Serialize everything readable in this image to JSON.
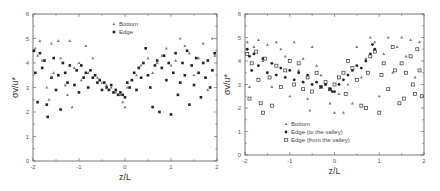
{
  "chart_data": [
    {
      "type": "scatter",
      "panel": "left",
      "xlabel": "z/L",
      "ylabel": "σv/u*",
      "xlim": [
        -2,
        2
      ],
      "ylim": [
        0,
        6
      ],
      "xticks": [
        "-2",
        "-1",
        "0",
        "1",
        "2"
      ],
      "yticks": [
        "0",
        "1",
        "2",
        "3",
        "4",
        "5",
        "6"
      ],
      "grid": false,
      "legend_position": "upper center",
      "series": [
        {
          "name": "Bottom",
          "marker": "triangle",
          "points": [
            [
              -1.95,
              4.6
            ],
            [
              -1.9,
              4.3
            ],
            [
              -1.85,
              4.9
            ],
            [
              -1.8,
              4.1
            ],
            [
              -1.7,
              3.0
            ],
            [
              -1.65,
              2.5
            ],
            [
              -1.6,
              4.8
            ],
            [
              -1.55,
              3.6
            ],
            [
              -1.45,
              4.9
            ],
            [
              -1.4,
              4.2
            ],
            [
              -1.3,
              3.1
            ],
            [
              -1.25,
              2.7
            ],
            [
              -1.2,
              4.9
            ],
            [
              -1.15,
              2.2
            ],
            [
              -1.1,
              3.8
            ],
            [
              -1.0,
              4.0
            ],
            [
              -0.95,
              3.3
            ],
            [
              -0.85,
              4.7
            ],
            [
              -0.8,
              3.6
            ],
            [
              -0.7,
              4.2
            ],
            [
              -0.6,
              3.4
            ],
            [
              -0.5,
              3.2
            ],
            [
              -0.4,
              3.1
            ],
            [
              -0.3,
              3.0
            ],
            [
              -0.2,
              2.8
            ],
            [
              -0.1,
              2.7
            ],
            [
              -0.05,
              2.4
            ],
            [
              0.0,
              2.2
            ],
            [
              0.05,
              3.0
            ],
            [
              0.15,
              3.3
            ],
            [
              0.25,
              3.5
            ],
            [
              0.35,
              3.9
            ],
            [
              0.5,
              4.2
            ],
            [
              0.6,
              3.6
            ],
            [
              0.7,
              4.0
            ],
            [
              0.8,
              4.3
            ],
            [
              0.9,
              4.6
            ],
            [
              1.0,
              3.9
            ],
            [
              1.1,
              4.1
            ],
            [
              1.2,
              5.0
            ],
            [
              1.3,
              4.7
            ],
            [
              1.4,
              4.4
            ],
            [
              1.5,
              3.5
            ],
            [
              1.6,
              4.2
            ],
            [
              1.7,
              4.8
            ],
            [
              1.8,
              2.9
            ],
            [
              1.9,
              5.0
            ],
            [
              1.95,
              4.3
            ]
          ]
        },
        {
          "name": "Edge",
          "marker": "filled-square",
          "points": [
            [
              -1.98,
              4.5
            ],
            [
              -1.95,
              3.6
            ],
            [
              -1.9,
              2.4
            ],
            [
              -1.85,
              4.4
            ],
            [
              -1.8,
              3.8
            ],
            [
              -1.75,
              4.1
            ],
            [
              -1.7,
              2.3
            ],
            [
              -1.68,
              1.8
            ],
            [
              -1.6,
              3.4
            ],
            [
              -1.55,
              4.2
            ],
            [
              -1.5,
              2.9
            ],
            [
              -1.45,
              3.5
            ],
            [
              -1.4,
              2.1
            ],
            [
              -1.35,
              4.0
            ],
            [
              -1.3,
              3.6
            ],
            [
              -1.25,
              3.2
            ],
            [
              -1.2,
              3.9
            ],
            [
              -1.1,
              3.1
            ],
            [
              -1.05,
              3.7
            ],
            [
              -1.0,
              2.8
            ],
            [
              -0.95,
              3.9
            ],
            [
              -0.9,
              3.4
            ],
            [
              -0.85,
              3.6
            ],
            [
              -0.8,
              3.0
            ],
            [
              -0.75,
              3.7
            ],
            [
              -0.7,
              3.4
            ],
            [
              -0.65,
              3.5
            ],
            [
              -0.6,
              3.2
            ],
            [
              -0.55,
              3.3
            ],
            [
              -0.5,
              2.9
            ],
            [
              -0.45,
              3.2
            ],
            [
              -0.4,
              3.0
            ],
            [
              -0.35,
              2.9
            ],
            [
              -0.3,
              3.1
            ],
            [
              -0.25,
              2.8
            ],
            [
              -0.2,
              2.9
            ],
            [
              -0.15,
              2.7
            ],
            [
              -0.1,
              2.8
            ],
            [
              -0.05,
              2.7
            ],
            [
              0.0,
              2.6
            ],
            [
              0.05,
              3.2
            ],
            [
              0.1,
              3.0
            ],
            [
              0.15,
              3.3
            ],
            [
              0.2,
              3.6
            ],
            [
              0.25,
              2.9
            ],
            [
              0.3,
              3.8
            ],
            [
              0.35,
              3.4
            ],
            [
              0.4,
              4.0
            ],
            [
              0.45,
              4.6
            ],
            [
              0.5,
              3.5
            ],
            [
              0.55,
              3.0
            ],
            [
              0.6,
              2.2
            ],
            [
              0.65,
              3.9
            ],
            [
              0.7,
              4.1
            ],
            [
              0.75,
              2.0
            ],
            [
              0.8,
              3.8
            ],
            [
              0.85,
              4.3
            ],
            [
              0.9,
              3.3
            ],
            [
              0.95,
              4.0
            ],
            [
              1.0,
              1.9
            ],
            [
              1.05,
              3.6
            ],
            [
              1.1,
              4.4
            ],
            [
              1.15,
              2.7
            ],
            [
              1.2,
              3.2
            ],
            [
              1.25,
              4.0
            ],
            [
              1.3,
              3.5
            ],
            [
              1.35,
              4.5
            ],
            [
              1.4,
              2.3
            ],
            [
              1.45,
              3.9
            ],
            [
              1.5,
              3.1
            ],
            [
              1.55,
              4.2
            ],
            [
              1.6,
              3.6
            ],
            [
              1.65,
              2.6
            ],
            [
              1.7,
              4.0
            ],
            [
              1.75,
              3.4
            ],
            [
              1.8,
              4.1
            ],
            [
              1.85,
              3.0
            ],
            [
              1.9,
              3.7
            ],
            [
              1.95,
              4.4
            ]
          ]
        }
      ]
    },
    {
      "type": "scatter",
      "panel": "right",
      "xlabel": "z/L",
      "ylabel": "σv/u*",
      "xlim": [
        -2,
        2
      ],
      "ylim": [
        0,
        6
      ],
      "xticks": [
        "-2",
        "-1",
        "0",
        "1",
        "2"
      ],
      "yticks": [
        "0",
        "1",
        "2",
        "3",
        "4",
        "5",
        "6"
      ],
      "grid": false,
      "legend_position": "lower left",
      "series": [
        {
          "name": "Bottom",
          "marker": "triangle",
          "points": [
            [
              -1.95,
              4.8
            ],
            [
              -1.9,
              2.9
            ],
            [
              -1.8,
              4.6
            ],
            [
              -1.7,
              4.9
            ],
            [
              -1.6,
              4.0
            ],
            [
              -1.5,
              4.7
            ],
            [
              -1.4,
              2.9
            ],
            [
              -1.3,
              4.8
            ],
            [
              -1.2,
              4.5
            ],
            [
              -1.1,
              4.2
            ],
            [
              -1.0,
              2.5
            ],
            [
              -0.9,
              4.8
            ],
            [
              -0.8,
              3.6
            ],
            [
              -0.7,
              4.1
            ],
            [
              -0.6,
              2.4
            ],
            [
              -0.55,
              1.9
            ],
            [
              -0.5,
              4.6
            ],
            [
              -0.4,
              3.8
            ],
            [
              -0.3,
              3.4
            ],
            [
              -0.2,
              3.0
            ],
            [
              -0.1,
              2.2
            ],
            [
              0.0,
              1.8
            ],
            [
              0.1,
              2.6
            ],
            [
              0.2,
              1.8
            ],
            [
              0.3,
              3.0
            ],
            [
              0.4,
              2.2
            ],
            [
              0.5,
              4.6
            ],
            [
              0.6,
              3.3
            ],
            [
              0.7,
              4.1
            ],
            [
              0.8,
              5.0
            ],
            [
              0.9,
              4.8
            ],
            [
              1.0,
              2.5
            ],
            [
              1.1,
              4.3
            ],
            [
              1.2,
              5.0
            ],
            [
              1.3,
              3.5
            ],
            [
              1.4,
              4.6
            ],
            [
              1.5,
              5.0
            ],
            [
              1.6,
              4.2
            ],
            [
              1.7,
              4.9
            ],
            [
              1.8,
              3.3
            ],
            [
              1.9,
              4.8
            ]
          ]
        },
        {
          "name": "Edge (to the valley)",
          "marker": "filled-circle",
          "points": [
            [
              -1.95,
              4.5
            ],
            [
              -1.9,
              4.2
            ],
            [
              -1.85,
              3.6
            ],
            [
              -1.8,
              4.3
            ],
            [
              -1.7,
              3.8
            ],
            [
              -1.6,
              4.1
            ],
            [
              -1.5,
              3.5
            ],
            [
              -1.4,
              3.9
            ],
            [
              -1.3,
              3.4
            ],
            [
              -1.2,
              3.7
            ],
            [
              -1.1,
              3.3
            ],
            [
              -1.0,
              3.6
            ],
            [
              -0.9,
              3.2
            ],
            [
              -0.8,
              3.5
            ],
            [
              -0.7,
              3.1
            ],
            [
              -0.6,
              3.4
            ],
            [
              -0.5,
              3.0
            ],
            [
              -0.4,
              3.1
            ],
            [
              -0.3,
              2.9
            ],
            [
              -0.2,
              3.0
            ],
            [
              -0.1,
              2.8
            ],
            [
              -0.05,
              2.7
            ],
            [
              0.0,
              2.7
            ],
            [
              0.1,
              3.0
            ],
            [
              0.2,
              3.2
            ],
            [
              0.3,
              3.4
            ],
            [
              0.4,
              3.6
            ],
            [
              0.5,
              3.8
            ],
            [
              0.6,
              3.7
            ],
            [
              0.7,
              4.0
            ],
            [
              0.8,
              4.3
            ],
            [
              0.85,
              4.7
            ],
            [
              0.9,
              4.5
            ]
          ]
        },
        {
          "name": "Edge (from the valley)",
          "marker": "open-square",
          "points": [
            [
              -1.95,
              4.3
            ],
            [
              -1.9,
              2.4
            ],
            [
              -1.85,
              3.9
            ],
            [
              -1.75,
              4.4
            ],
            [
              -1.7,
              3.2
            ],
            [
              -1.65,
              2.2
            ],
            [
              -1.6,
              1.8
            ],
            [
              -1.55,
              4.1
            ],
            [
              -1.45,
              3.3
            ],
            [
              -1.4,
              2.1
            ],
            [
              -1.3,
              3.8
            ],
            [
              -1.2,
              2.9
            ],
            [
              -1.1,
              3.6
            ],
            [
              -1.0,
              4.0
            ],
            [
              -0.9,
              3.0
            ],
            [
              -0.8,
              3.9
            ],
            [
              -0.7,
              2.8
            ],
            [
              -0.6,
              3.3
            ],
            [
              -0.5,
              2.7
            ],
            [
              -0.4,
              3.5
            ],
            [
              -0.3,
              2.9
            ],
            [
              -0.2,
              3.1
            ],
            [
              -0.1,
              2.8
            ],
            [
              0.0,
              3.0
            ],
            [
              0.1,
              3.3
            ],
            [
              0.2,
              3.5
            ],
            [
              0.25,
              2.6
            ],
            [
              0.3,
              4.0
            ],
            [
              0.4,
              3.7
            ],
            [
              0.5,
              3.2
            ],
            [
              0.6,
              2.1
            ],
            [
              0.7,
              2.0
            ],
            [
              0.75,
              3.5
            ],
            [
              0.8,
              4.2
            ],
            [
              0.9,
              4.4
            ],
            [
              1.0,
              1.8
            ],
            [
              1.05,
              3.4
            ],
            [
              1.1,
              3.9
            ],
            [
              1.2,
              2.8
            ],
            [
              1.3,
              4.6
            ],
            [
              1.35,
              3.6
            ],
            [
              1.45,
              2.2
            ],
            [
              1.5,
              3.9
            ],
            [
              1.55,
              2.4
            ],
            [
              1.6,
              3.5
            ],
            [
              1.7,
              4.2
            ],
            [
              1.75,
              3.0
            ],
            [
              1.8,
              2.6
            ],
            [
              1.85,
              4.5
            ],
            [
              1.9,
              3.6
            ],
            [
              1.95,
              2.5
            ]
          ]
        }
      ]
    }
  ],
  "left_chart": {
    "xlabel": "z/L",
    "ylabel": "σv/u*",
    "legend": [
      "Bottom",
      "Edge"
    ]
  },
  "right_chart": {
    "xlabel": "z/L",
    "ylabel": "σv/u*",
    "legend": [
      "Bottom",
      "Edge (to the valley)",
      "Edge (from the valley)"
    ]
  },
  "colors": {
    "axis": "#555555",
    "marker_dark": "#222222",
    "marker_gray": "#666666",
    "background": "#ffffff"
  }
}
